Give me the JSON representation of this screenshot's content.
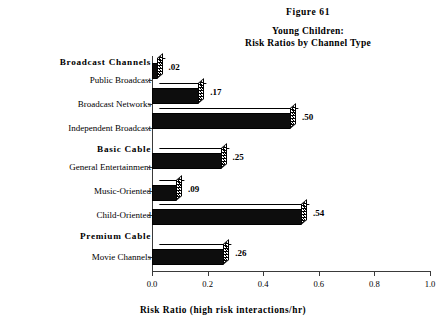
{
  "figure": {
    "number_label": "Figure 61",
    "title_line1": "Young Children:",
    "title_line2": "Risk Ratios by Channel Type"
  },
  "chart_data": {
    "type": "bar",
    "orientation": "horizontal",
    "title": "Young Children: Risk Ratios by Channel Type",
    "figure_label": "Figure 61",
    "xlabel": "Risk Ratio (high risk interactions/hr)",
    "ylabel": "",
    "xlim": [
      0.0,
      1.0
    ],
    "grid": false,
    "legend": null,
    "categories": [
      "Public Broadcast",
      "Broadcast Networks",
      "Independent Broadcast",
      "General Entertainment",
      "Music-Oriented",
      "Child-Oriented",
      "Movie Channels"
    ],
    "values": [
      0.02,
      0.17,
      0.5,
      0.25,
      0.09,
      0.54,
      0.26
    ],
    "value_labels": [
      ".02",
      ".17",
      ".50",
      ".25",
      ".09",
      ".54",
      ".26"
    ],
    "groups": [
      {
        "label": "Broadcast Channels",
        "categories": [
          "Public Broadcast",
          "Broadcast Networks",
          "Independent Broadcast"
        ]
      },
      {
        "label": "Basic  Cable",
        "categories": [
          "General Entertainment",
          "Music-Oriented",
          "Child-Oriented"
        ]
      },
      {
        "label": "Premium  Cable",
        "categories": [
          "Movie Channels"
        ]
      }
    ],
    "xticks": [
      0.0,
      0.2,
      0.4,
      0.6,
      0.8,
      1.0
    ],
    "xtick_labels": [
      "0.0",
      "0.2",
      "0.4",
      "0.6",
      "0.8",
      "1.0"
    ],
    "colors": {
      "bar_face": "#0d0d0d",
      "bar_top": "#ffffff",
      "axis": "#3a3a3a",
      "text": "#000000"
    }
  },
  "axis": {
    "x_title": "Risk Ratio (high risk interactions/hr)"
  },
  "rows": [
    {
      "kind": "group",
      "label": "Broadcast Channels",
      "top": 57,
      "bar": null
    },
    {
      "kind": "cat",
      "label": "Public Broadcast",
      "top": 75,
      "bar": {
        "value": 0.02,
        "text": ".02",
        "top": 2
      }
    },
    {
      "kind": "cat",
      "label": "Broadcast Networks",
      "top": 99,
      "bar": {
        "value": 0.17,
        "text": ".17",
        "top": 27
      }
    },
    {
      "kind": "cat",
      "label": "Independent Broadcast",
      "top": 123,
      "bar": {
        "value": 0.5,
        "text": ".50",
        "top": 52
      }
    },
    {
      "kind": "group",
      "label": "Basic  Cable",
      "top": 144,
      "bar": null
    },
    {
      "kind": "cat",
      "label": "General Entertainment",
      "top": 162,
      "bar": {
        "value": 0.25,
        "text": ".25",
        "top": 92
      }
    },
    {
      "kind": "cat",
      "label": "Music-Oriented",
      "top": 186,
      "bar": {
        "value": 0.09,
        "text": ".09",
        "top": 124
      }
    },
    {
      "kind": "cat",
      "label": "Child-Oriented",
      "top": 210,
      "bar": {
        "value": 0.54,
        "text": ".54",
        "top": 148
      }
    },
    {
      "kind": "group",
      "label": "Premium  Cable",
      "top": 231,
      "bar": null
    },
    {
      "kind": "cat",
      "label": "Movie Channels",
      "top": 252,
      "bar": {
        "value": 0.26,
        "text": ".26",
        "top": 188
      }
    }
  ]
}
